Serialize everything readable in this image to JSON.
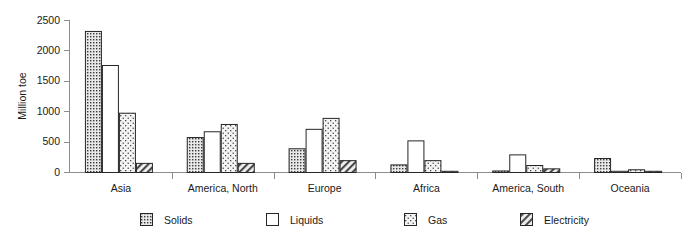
{
  "chart_data": {
    "type": "bar",
    "title": "",
    "xlabel": "",
    "ylabel": "Million toe",
    "ylim": [
      0,
      2500
    ],
    "ytick_labels": [
      "0",
      "500",
      "1000",
      "1500",
      "2000",
      "2500"
    ],
    "yticks": [
      0,
      500,
      1000,
      1500,
      2000,
      2500
    ],
    "grid": false,
    "legend_position": "bottom",
    "categories": [
      "Asia",
      "America, North",
      "Europe",
      "Africa",
      "America, South",
      "Oceania"
    ],
    "series": [
      {
        "name": "Solids",
        "pattern": "dense-dots",
        "values": [
          2320,
          575,
          390,
          125,
          25,
          230
        ]
      },
      {
        "name": "Liquids",
        "pattern": "empty",
        "values": [
          1760,
          670,
          710,
          520,
          290,
          8
        ]
      },
      {
        "name": "Gas",
        "pattern": "sparse-dots",
        "values": [
          975,
          790,
          890,
          195,
          115,
          45
        ]
      },
      {
        "name": "Electricity",
        "pattern": "diagonal",
        "values": [
          150,
          150,
          195,
          15,
          60,
          10
        ]
      }
    ]
  },
  "legend": {
    "items": [
      {
        "label": "Solids"
      },
      {
        "label": "Liquids"
      },
      {
        "label": "Gas"
      },
      {
        "label": "Electricity"
      }
    ]
  }
}
